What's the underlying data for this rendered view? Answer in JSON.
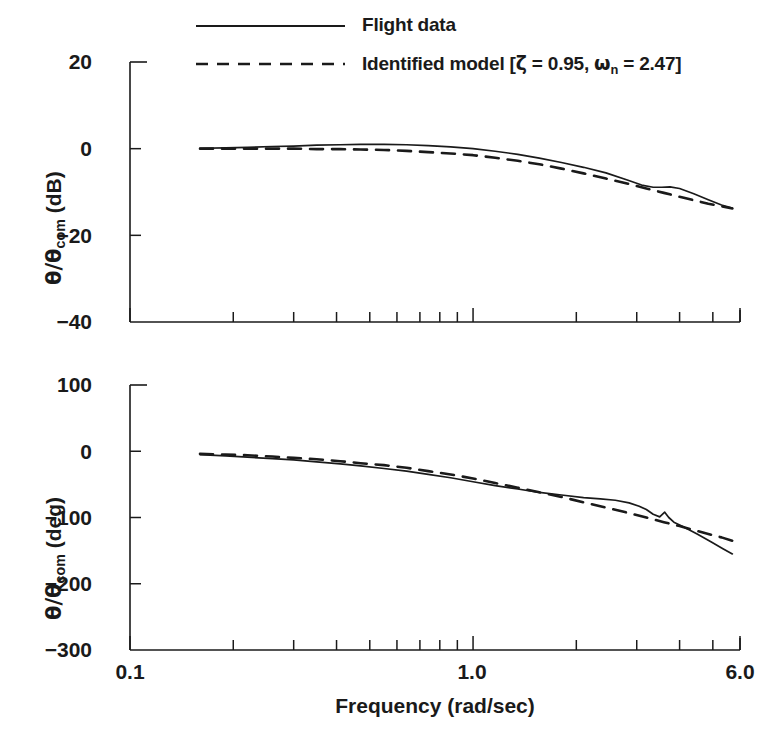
{
  "figure": {
    "legend": [
      {
        "label": "Flight data",
        "style": "solid",
        "icon": "solid-line-swatch"
      },
      {
        "label": "Identified model [ζ = 0.95, ωn = 2.47]",
        "style": "dashed",
        "icon": "dashed-line-swatch",
        "parts": {
          "prefix": "Identified model [",
          "zeta_sym": "ζ",
          "zeta_eq": " = 0.95, ",
          "omega_sym": "ω",
          "omega_sub": "n",
          "omega_eq": " = 2.47]"
        }
      }
    ],
    "xaxis": {
      "label": "Frequency (rad/sec)",
      "ticks": [
        "0.1",
        "1.0",
        "6.0"
      ],
      "scale": "log",
      "min": 0.1,
      "max": 6.0
    },
    "magnitude": {
      "ylabel_num": "θ/θ",
      "ylabel_sub": "com",
      "ylabel_unit": " (dB)",
      "ticks": [
        "20",
        "0",
        "−20",
        "−40"
      ],
      "ymin": -40,
      "ymax": 20
    },
    "phase": {
      "ylabel_num": "θ/θ",
      "ylabel_sub": "com",
      "ylabel_unit": " (deg)",
      "ticks": [
        "100",
        "0",
        "−100",
        "−200",
        "−300"
      ],
      "ymin": -300,
      "ymax": 100
    }
  },
  "chart_data": {
    "type": "line",
    "title": "",
    "subplots": [
      {
        "name": "magnitude",
        "xlabel": "Frequency (rad/sec)",
        "ylabel": "θ/θcom (dB)",
        "xscale": "log",
        "xlim": [
          0.1,
          6.0
        ],
        "ylim": [
          -40,
          20
        ],
        "yticks": [
          20,
          0,
          -20,
          -40
        ],
        "xticks": [
          0.1,
          1.0,
          6.0
        ],
        "grid": false,
        "series": [
          {
            "name": "Flight data",
            "style": "solid",
            "x": [
              0.16,
              0.19,
              0.22,
              0.26,
              0.3,
              0.35,
              0.41,
              0.47,
              0.55,
              0.64,
              0.74,
              0.86,
              1.0,
              1.16,
              1.35,
              1.56,
              1.81,
              2.1,
              2.44,
              2.83,
              3.1,
              3.35,
              3.55,
              3.75,
              4.0,
              4.4,
              4.85,
              5.3,
              5.7
            ],
            "y": [
              0.1,
              0.2,
              0.3,
              0.5,
              0.6,
              0.8,
              0.9,
              1.0,
              1.0,
              0.9,
              0.7,
              0.4,
              0.0,
              -0.6,
              -1.3,
              -2.2,
              -3.2,
              -4.3,
              -5.6,
              -7.3,
              -8.4,
              -8.9,
              -8.9,
              -8.8,
              -9.2,
              -10.4,
              -11.8,
              -13.0,
              -13.7
            ]
          },
          {
            "name": "Identified model",
            "style": "dashed",
            "x": [
              0.16,
              0.19,
              0.22,
              0.26,
              0.3,
              0.35,
              0.41,
              0.47,
              0.55,
              0.64,
              0.74,
              0.86,
              1.0,
              1.16,
              1.35,
              1.56,
              1.81,
              2.1,
              2.44,
              2.83,
              3.2,
              3.6,
              4.0,
              4.4,
              4.85,
              5.3,
              5.7
            ],
            "y": [
              0.0,
              0.0,
              0.0,
              0.0,
              0.0,
              -0.1,
              -0.1,
              -0.2,
              -0.3,
              -0.5,
              -0.8,
              -1.1,
              -1.5,
              -2.1,
              -2.8,
              -3.6,
              -4.6,
              -5.7,
              -6.9,
              -8.1,
              -9.2,
              -10.2,
              -11.1,
              -11.9,
              -12.7,
              -13.3,
              -13.8
            ]
          }
        ]
      },
      {
        "name": "phase",
        "xlabel": "Frequency (rad/sec)",
        "ylabel": "θ/θcom (deg)",
        "xscale": "log",
        "xlim": [
          0.1,
          6.0
        ],
        "ylim": [
          -300,
          100
        ],
        "yticks": [
          100,
          0,
          -100,
          -200,
          -300
        ],
        "xticks": [
          0.1,
          1.0,
          6.0
        ],
        "grid": false,
        "series": [
          {
            "name": "Flight data",
            "style": "solid",
            "x": [
              0.16,
              0.19,
              0.22,
              0.26,
              0.3,
              0.35,
              0.41,
              0.47,
              0.55,
              0.64,
              0.74,
              0.86,
              1.0,
              1.16,
              1.35,
              1.56,
              1.81,
              2.1,
              2.35,
              2.6,
              2.85,
              3.05,
              3.2,
              3.35,
              3.5,
              3.62,
              3.72,
              3.85,
              4.1,
              4.5,
              4.95,
              5.35,
              5.7
            ],
            "y": [
              -5,
              -7,
              -9,
              -11,
              -13,
              -16,
              -19,
              -22,
              -26,
              -30,
              -35,
              -40,
              -46,
              -52,
              -57,
              -62,
              -66,
              -70,
              -72,
              -74,
              -78,
              -83,
              -88,
              -95,
              -99,
              -92,
              -100,
              -107,
              -114,
              -125,
              -137,
              -147,
              -155
            ]
          },
          {
            "name": "Identified model",
            "style": "dashed",
            "x": [
              0.16,
              0.19,
              0.22,
              0.26,
              0.3,
              0.35,
              0.41,
              0.47,
              0.55,
              0.64,
              0.74,
              0.86,
              1.0,
              1.16,
              1.35,
              1.56,
              1.81,
              2.1,
              2.44,
              2.83,
              3.2,
              3.6,
              4.0,
              4.4,
              4.85,
              5.3,
              5.7
            ],
            "y": [
              -4,
              -5,
              -6,
              -8,
              -10,
              -12,
              -15,
              -18,
              -21,
              -25,
              -30,
              -35,
              -41,
              -48,
              -55,
              -62,
              -69,
              -77,
              -85,
              -93,
              -100,
              -107,
              -113,
              -119,
              -125,
              -130,
              -135
            ]
          }
        ]
      }
    ]
  }
}
